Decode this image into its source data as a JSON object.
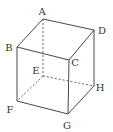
{
  "diagram": {
    "type": "cube",
    "vertices": {
      "A": {
        "label": "A",
        "x": 43,
        "y": 19,
        "lx": 42,
        "ly": 15
      },
      "B": {
        "label": "B",
        "x": 17,
        "y": 47,
        "lx": 9,
        "ly": 51
      },
      "C": {
        "label": "C",
        "x": 69,
        "y": 60,
        "lx": 75,
        "ly": 66
      },
      "D": {
        "label": "D",
        "x": 94,
        "y": 30,
        "lx": 102,
        "ly": 34
      },
      "E": {
        "label": "E",
        "x": 43,
        "y": 76,
        "lx": 36,
        "ly": 74
      },
      "F": {
        "label": "F",
        "x": 17,
        "y": 101,
        "lx": 10,
        "ly": 113
      },
      "G": {
        "label": "G",
        "x": 68,
        "y": 114,
        "lx": 67,
        "ly": 129
      },
      "H": {
        "label": "H",
        "x": 94,
        "y": 86,
        "lx": 100,
        "ly": 91
      }
    },
    "visible_edges": [
      "AB",
      "AD",
      "BC",
      "CD",
      "BF",
      "CG",
      "DH",
      "FG",
      "GH"
    ],
    "hidden_edges": [
      "AE",
      "EF",
      "EH"
    ],
    "colors": {
      "edge": "#333333",
      "hidden_edge": "#555555",
      "background": "#ffffff"
    }
  }
}
